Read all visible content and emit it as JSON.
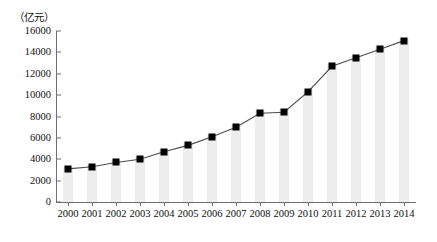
{
  "chart_data": {
    "type": "line",
    "title": "",
    "subtitle": "",
    "xlabel": "",
    "ylabel": "（亿元）",
    "unit_label": "（亿元）",
    "categories": [
      "2000",
      "2001",
      "2002",
      "2003",
      "2004",
      "2005",
      "2006",
      "2007",
      "2008",
      "2009",
      "2010",
      "2011",
      "2012",
      "2013",
      "2014"
    ],
    "values": [
      3100,
      3300,
      3700,
      4000,
      4700,
      5300,
      6100,
      7000,
      8300,
      8400,
      10300,
      12700,
      13500,
      14300,
      15100
    ],
    "series": [
      {
        "name": "",
        "values": [
          3100,
          3300,
          3700,
          4000,
          4700,
          5300,
          6100,
          7000,
          8300,
          8400,
          10300,
          12700,
          13500,
          14300,
          15100
        ]
      }
    ],
    "ylim": [
      0,
      16000
    ],
    "yticks": [
      0,
      2000,
      4000,
      6000,
      8000,
      10000,
      12000,
      14000,
      16000
    ],
    "ytick_labels": [
      "0",
      "2000",
      "4000",
      "6000",
      "8000",
      "10000",
      "12000",
      "14000",
      "16000"
    ],
    "grid": false,
    "legend": null,
    "legend_position": "none",
    "marker_style": "square",
    "marker_color": "#000000",
    "line_color": "#4d4d4d",
    "bar_color": "#ededed",
    "axis_color": "#6f6f6f",
    "background_color": "#ffffff",
    "annotations": []
  }
}
